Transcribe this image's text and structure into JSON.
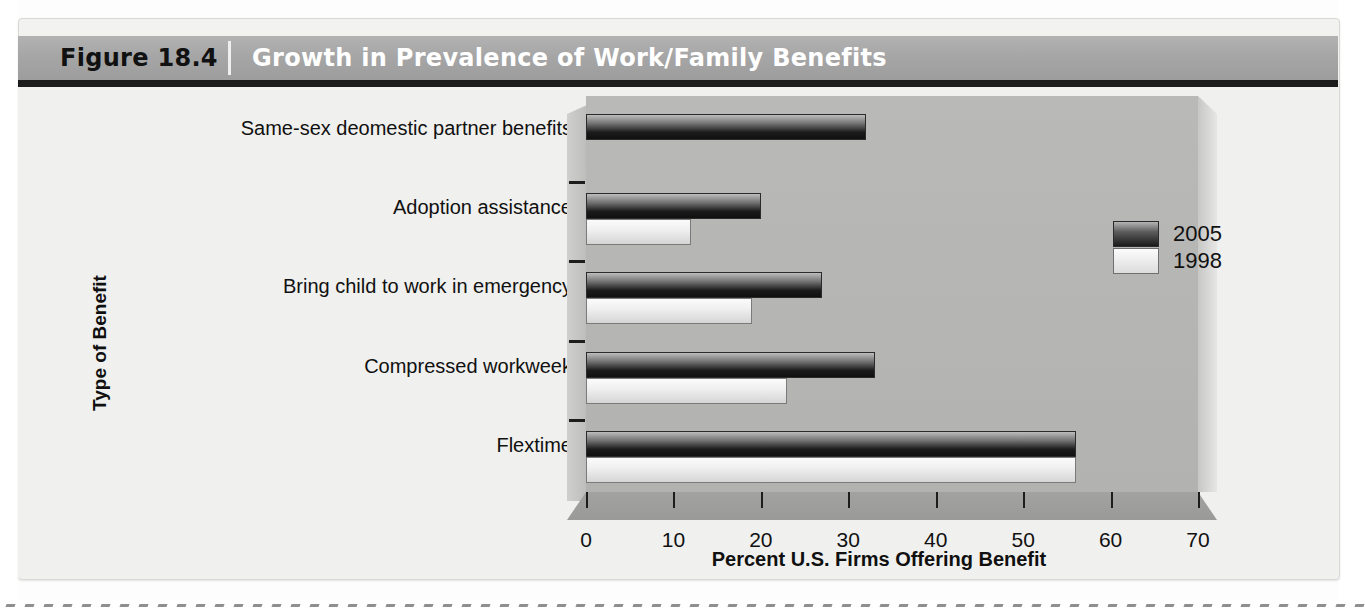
{
  "figure": {
    "number_label": "Figure 18.4",
    "title": "Growth in Prevalence of Work/Family Benefits"
  },
  "chart_data": {
    "type": "bar",
    "orientation": "horizontal",
    "title": "Growth in Prevalence of Work/Family Benefits",
    "xlabel": "Percent U.S. Firms Offering Benefit",
    "ylabel": "Type of Benefit",
    "xlim": [
      0,
      70
    ],
    "xticks": [
      "0",
      "10",
      "20",
      "30",
      "40",
      "50",
      "60",
      "70"
    ],
    "grid": false,
    "legend_position": "top-right",
    "categories": [
      "Same-sex deomestic partner benefits",
      "Adoption assistance",
      "Bring child to work in emergency",
      "Compressed workweek",
      "Flextime"
    ],
    "series": [
      {
        "name": "2005",
        "color": "#1b1b1b",
        "values": [
          32,
          20,
          27,
          33,
          56
        ]
      },
      {
        "name": "1998",
        "color": "#ececec",
        "values": [
          null,
          12,
          19,
          23,
          56
        ]
      }
    ]
  },
  "legend": {
    "items": [
      {
        "label": "2005"
      },
      {
        "label": "1998"
      }
    ]
  },
  "axis": {
    "x_title": "Percent U.S. Firms Offering Benefit",
    "y_title": "Type of Benefit"
  }
}
